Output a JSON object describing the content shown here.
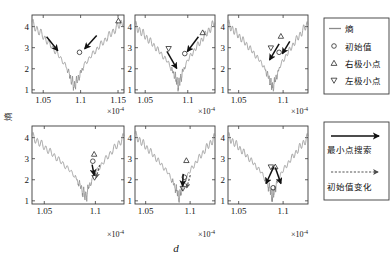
{
  "figure": {
    "axis_labels": {
      "y": "熵",
      "x": "d"
    },
    "exponent_label": "×10",
    "exponent_power": "-4"
  },
  "legend_markers": {
    "title": "标记图例",
    "items": [
      {
        "symbol": "line",
        "label": "熵",
        "icon": "line-icon"
      },
      {
        "symbol": "circle",
        "label": "初始值",
        "icon": "circle-marker-icon"
      },
      {
        "symbol": "triangle-up",
        "label": "右极小点",
        "icon": "triangle-up-icon"
      },
      {
        "symbol": "triangle-down",
        "label": "左极小点",
        "icon": "triangle-down-icon"
      }
    ]
  },
  "legend_arrows": {
    "title": "箭头图例",
    "items": [
      {
        "symbol": "solid-arrow",
        "label": "最小点搜索",
        "icon": "solid-arrow-icon"
      },
      {
        "symbol": "dashed-arrow",
        "label": "初始值变化",
        "icon": "dashed-arrow-icon"
      }
    ]
  },
  "chart_data": {
    "type": "line",
    "title": "",
    "xlabel": "d",
    "ylabel": "熵",
    "x_exponent": "×10⁻⁴",
    "grid": false,
    "legend_position": "right",
    "panels": [
      {
        "id": "panel-1",
        "row": 0,
        "col": 0,
        "xlim": [
          1.035,
          1.158
        ],
        "ylim": [
          0.85,
          4.55
        ],
        "xticks": [
          1.05,
          1.1,
          1.15
        ],
        "xtick_labels": [
          "1.05",
          "1.1",
          "1.15"
        ],
        "yticks": [
          1,
          2,
          3,
          4
        ],
        "ytick_labels": [
          "1",
          "2",
          "3",
          "4"
        ],
        "valley_x": 1.0915,
        "valley_y": 1.42,
        "left_edge_y": 4.15,
        "right_edge_y": 4.3,
        "ripple_amp": 0.16,
        "ripple_freq": 46,
        "markers": [
          {
            "type": "circle",
            "x": 1.0985,
            "y": 2.78,
            "label": "初始值"
          },
          {
            "type": "triangle-up",
            "x": 1.1505,
            "y": 4.28,
            "label": "右极小点"
          }
        ],
        "arrows": [
          {
            "style": "solid",
            "x1": 1.0545,
            "y1": 3.52,
            "x2": 1.0695,
            "y2": 2.86
          },
          {
            "style": "solid",
            "x1": 1.1215,
            "y1": 3.58,
            "x2": 1.1055,
            "y2": 2.95
          }
        ]
      },
      {
        "id": "panel-2",
        "row": 0,
        "col": 1,
        "xlim": [
          1.038,
          1.132
        ],
        "ylim": [
          0.85,
          4.55
        ],
        "xticks": [
          1.05,
          1.1
        ],
        "xtick_labels": [
          "1.05",
          "1.1"
        ],
        "yticks": [
          1,
          2,
          3,
          4
        ],
        "ytick_labels": [
          "1",
          "2",
          "3",
          "4"
        ],
        "valley_x": 1.089,
        "valley_y": 1.52,
        "left_edge_y": 4.05,
        "right_edge_y": 4.2,
        "ripple_amp": 0.16,
        "ripple_freq": 44,
        "markers": [
          {
            "type": "circle",
            "x": 1.0965,
            "y": 2.72,
            "label": "初始值"
          },
          {
            "type": "triangle-down",
            "x": 1.0775,
            "y": 2.95,
            "label": "左极小点"
          },
          {
            "type": "triangle-up",
            "x": 1.1175,
            "y": 3.72,
            "label": "右极小点"
          }
        ],
        "arrows": [
          {
            "style": "solid",
            "x1": 1.0755,
            "y1": 2.82,
            "x2": 1.087,
            "y2": 2.02
          },
          {
            "style": "solid",
            "x1": 1.1125,
            "y1": 3.52,
            "x2": 1.0995,
            "y2": 2.82
          }
        ]
      },
      {
        "id": "panel-3",
        "row": 0,
        "col": 2,
        "xlim": [
          1.038,
          1.128
        ],
        "ylim": [
          0.85,
          4.55
        ],
        "xticks": [
          1.05,
          1.1
        ],
        "xtick_labels": [
          "1.05",
          "1.1"
        ],
        "yticks": [
          1,
          2,
          3,
          4
        ],
        "ytick_labels": [
          "1",
          "2",
          "3",
          "4"
        ],
        "valley_x": 1.0885,
        "valley_y": 1.38,
        "left_edge_y": 4.12,
        "right_edge_y": 4.15,
        "ripple_amp": 0.155,
        "ripple_freq": 45,
        "markers": [
          {
            "type": "circle",
            "x": 1.0955,
            "y": 2.78,
            "label": "初始值"
          },
          {
            "type": "triangle-down",
            "x": 1.0862,
            "y": 2.98,
            "label": "左极小点"
          },
          {
            "type": "triangle-up",
            "x": 1.0975,
            "y": 3.55,
            "label": "右极小点"
          }
        ],
        "arrows": [
          {
            "style": "solid",
            "x1": 1.0955,
            "y1": 3.18,
            "x2": 1.0848,
            "y2": 2.42
          },
          {
            "style": "solid",
            "x1": 1.1075,
            "y1": 3.3,
            "x2": 1.0992,
            "y2": 2.72
          }
        ]
      },
      {
        "id": "panel-4",
        "row": 1,
        "col": 0,
        "xlim": [
          1.038,
          1.128
        ],
        "ylim": [
          0.85,
          4.55
        ],
        "xticks": [
          1.05,
          1.1
        ],
        "xtick_labels": [
          "1.05",
          "1.1"
        ],
        "yticks": [
          1,
          2,
          3,
          4
        ],
        "ytick_labels": [
          "1",
          "2",
          "3",
          "4"
        ],
        "valley_x": 1.0905,
        "valley_y": 1.5,
        "left_edge_y": 4.05,
        "right_edge_y": 4.02,
        "ripple_amp": 0.15,
        "ripple_freq": 43,
        "markers": [
          {
            "type": "circle",
            "x": 1.0975,
            "y": 2.88,
            "label": "初始值"
          },
          {
            "type": "triangle-up",
            "x": 1.0988,
            "y": 3.22,
            "label": "右极小点"
          },
          {
            "type": "triangle-down",
            "x": 1.0992,
            "y": 2.1,
            "label": "左极小点"
          }
        ],
        "arrows": [
          {
            "style": "solid",
            "x1": 1.0968,
            "y1": 2.72,
            "x2": 1.0988,
            "y2": 2.22
          },
          {
            "style": "dashed",
            "x1": 1.1042,
            "y1": 2.7,
            "x2": 1.1008,
            "y2": 2.1
          }
        ]
      },
      {
        "id": "panel-5",
        "row": 1,
        "col": 1,
        "xlim": [
          1.038,
          1.128
        ],
        "ylim": [
          0.85,
          4.55
        ],
        "xticks": [
          1.05,
          1.1
        ],
        "xtick_labels": [
          "1.05",
          "1.1"
        ],
        "yticks": [
          1,
          2,
          3,
          4
        ],
        "ytick_labels": [
          "1",
          "2",
          "3",
          "4"
        ],
        "valley_x": 1.0878,
        "valley_y": 1.45,
        "left_edge_y": 4.12,
        "right_edge_y": 4.02,
        "ripple_amp": 0.15,
        "ripple_freq": 43,
        "markers": [
          {
            "type": "circle",
            "x": 1.0935,
            "y": 2.12,
            "label": "初始值"
          },
          {
            "type": "triangle-up",
            "x": 1.0958,
            "y": 2.92,
            "label": "右极小点"
          },
          {
            "type": "triangle-down",
            "x": 1.0918,
            "y": 1.58,
            "label": "左极小点"
          }
        ],
        "arrows": [
          {
            "style": "solid",
            "x1": 1.0922,
            "y1": 2.28,
            "x2": 1.0915,
            "y2": 1.7
          },
          {
            "style": "dashed",
            "x1": 1.1002,
            "y1": 2.22,
            "x2": 1.0962,
            "y2": 1.62
          }
        ]
      },
      {
        "id": "panel-6",
        "row": 1,
        "col": 2,
        "xlim": [
          1.038,
          1.128
        ],
        "ylim": [
          0.85,
          4.55
        ],
        "xticks": [
          1.05,
          1.1
        ],
        "xtick_labels": [
          "1.05",
          "1.1"
        ],
        "yticks": [
          1,
          2,
          3,
          4
        ],
        "ytick_labels": [
          "1",
          "2",
          "3",
          "4"
        ],
        "valley_x": 1.0882,
        "valley_y": 1.52,
        "left_edge_y": 4.05,
        "right_edge_y": 4.02,
        "ripple_amp": 0.15,
        "ripple_freq": 43,
        "markers": [
          {
            "type": "circle",
            "x": 1.0888,
            "y": 1.62,
            "label": "初始值"
          },
          {
            "type": "triangle-up",
            "x": 1.0912,
            "y": 2.62,
            "label": "右极小点"
          },
          {
            "type": "triangle-down",
            "x": 1.0862,
            "y": 2.6,
            "label": "左极小点"
          }
        ],
        "arrows": [
          {
            "style": "solid",
            "x1": 1.0895,
            "y1": 2.62,
            "x2": 1.0808,
            "y2": 1.82
          },
          {
            "style": "solid",
            "x1": 1.0912,
            "y1": 2.58,
            "x2": 1.0975,
            "y2": 1.82
          }
        ]
      }
    ]
  }
}
